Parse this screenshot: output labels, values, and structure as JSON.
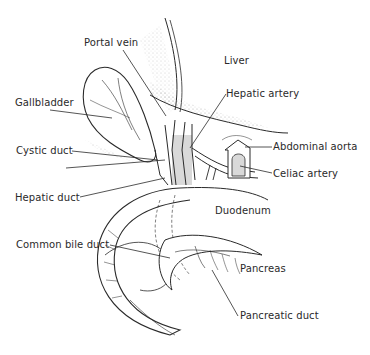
{
  "diagram": {
    "type": "anatomical-illustration",
    "labels": [
      {
        "id": "portal-vein",
        "text": "Portal vein",
        "x": 84,
        "y": 37
      },
      {
        "id": "liver",
        "text": "Liver",
        "x": 224,
        "y": 55
      },
      {
        "id": "gallbladder",
        "text": "Gallbladder",
        "x": 15,
        "y": 97
      },
      {
        "id": "hepatic-artery",
        "text": "Hepatic artery",
        "x": 226,
        "y": 88
      },
      {
        "id": "cystic-duct",
        "text": "Cystic duct",
        "x": 16,
        "y": 145
      },
      {
        "id": "abdominal-aorta",
        "text": "Abdominal aorta",
        "x": 273,
        "y": 141
      },
      {
        "id": "celiac-artery",
        "text": "Celiac artery",
        "x": 273,
        "y": 168
      },
      {
        "id": "hepatic-duct",
        "text": "Hepatic duct",
        "x": 15,
        "y": 192
      },
      {
        "id": "duodenum",
        "text": "Duodenum",
        "x": 215,
        "y": 205
      },
      {
        "id": "common-bile-duct",
        "text": "Common bile duct",
        "x": 16,
        "y": 239
      },
      {
        "id": "pancreas",
        "text": "Pancreas",
        "x": 240,
        "y": 263
      },
      {
        "id": "pancreatic-duct",
        "text": "Pancreatic duct",
        "x": 240,
        "y": 310
      }
    ],
    "colors": {
      "ink": "#2a2a2a",
      "shade": "#d9d9d9",
      "background": "#ffffff"
    }
  }
}
